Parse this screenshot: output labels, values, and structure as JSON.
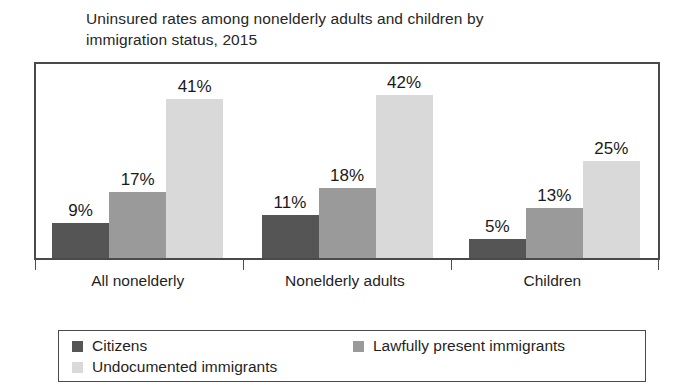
{
  "chart_data": {
    "type": "bar",
    "title": "Uninsured rates among nonelderly adults and children by\nimmigration status, 2015",
    "xlabel": "",
    "ylabel": "",
    "ylim": [
      0,
      50
    ],
    "grid": false,
    "legend_position": "bottom",
    "value_suffix": "%",
    "categories": [
      "All nonelderly",
      "Nonelderly adults",
      "Children"
    ],
    "series": [
      {
        "name": "Citizens",
        "color": "#555555",
        "values": [
          9,
          11,
          5
        ],
        "labels": [
          "9%",
          "11%",
          "5%"
        ]
      },
      {
        "name": "Lawfully present immigrants",
        "color": "#9a9a9a",
        "values": [
          17,
          18,
          13
        ],
        "labels": [
          "17%",
          "18%",
          "13%"
        ]
      },
      {
        "name": "Undocumented immigrants",
        "color": "#d9d9d9",
        "values": [
          41,
          42,
          25
        ],
        "labels": [
          "41%",
          "42%",
          "25%"
        ]
      }
    ]
  },
  "legend": {
    "items": [
      {
        "label": "Citizens",
        "color": "#555555"
      },
      {
        "label": "Lawfully present immigrants",
        "color": "#9a9a9a"
      },
      {
        "label": "Undocumented immigrants",
        "color": "#d9d9d9"
      }
    ]
  }
}
